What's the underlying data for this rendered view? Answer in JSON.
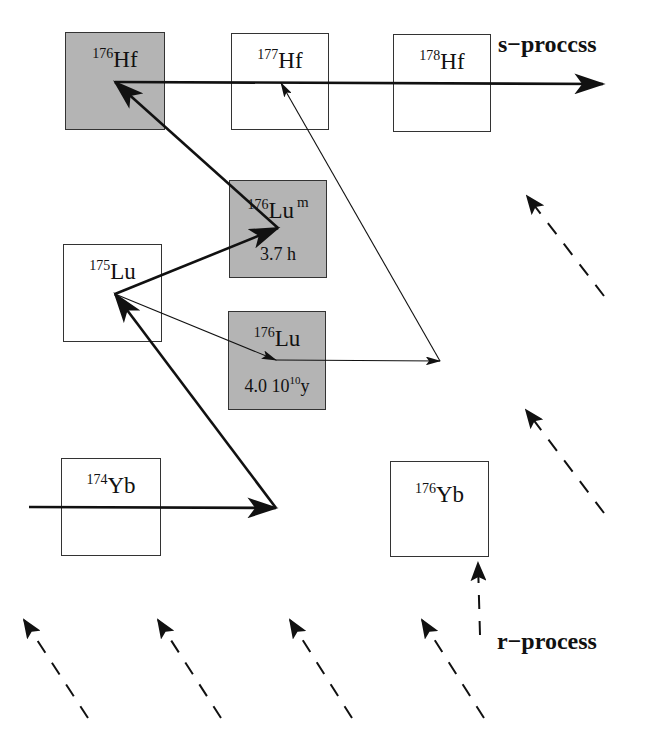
{
  "diagram": {
    "process_labels": {
      "s_process": "s−proccss",
      "r_process": "r−process"
    },
    "nuclides": [
      {
        "id": "hf176",
        "mass": "176",
        "symbol": "Hf",
        "meta": "",
        "half_life": "",
        "stable_shaded": true,
        "box": [
          65,
          32,
          100,
          98
        ]
      },
      {
        "id": "hf177",
        "mass": "177",
        "symbol": "Hf",
        "meta": "",
        "half_life": "",
        "stable_shaded": false,
        "box": [
          231,
          33,
          98,
          97
        ]
      },
      {
        "id": "hf178",
        "mass": "178",
        "symbol": "Hf",
        "meta": "",
        "half_life": "",
        "stable_shaded": false,
        "box": [
          393,
          34,
          98,
          98
        ]
      },
      {
        "id": "lu176m",
        "mass": "176",
        "symbol": "Lu",
        "meta": "m",
        "half_life": "3.7 h",
        "stable_shaded": true,
        "box": [
          229,
          180,
          98,
          98
        ]
      },
      {
        "id": "lu175",
        "mass": "175",
        "symbol": "Lu",
        "meta": "",
        "half_life": "",
        "stable_shaded": false,
        "box": [
          63,
          244,
          99,
          98
        ]
      },
      {
        "id": "lu176",
        "mass": "176",
        "symbol": "Lu",
        "meta": "",
        "half_life_mantissa": "4.0 10",
        "half_life_exp": "10",
        "half_life_unit": "y",
        "stable_shaded": true,
        "box": [
          228,
          311,
          98,
          99
        ]
      },
      {
        "id": "yb174",
        "mass": "174",
        "symbol": "Yb",
        "meta": "",
        "half_life": "",
        "stable_shaded": false,
        "box": [
          61,
          458,
          100,
          98
        ]
      },
      {
        "id": "yb176",
        "mass": "176",
        "symbol": "Yb",
        "meta": "",
        "half_life": "",
        "stable_shaded": false,
        "box": [
          390,
          461,
          99,
          96
        ]
      }
    ],
    "arrows": {
      "solid_thick": [
        {
          "name": "s-process-main-path",
          "from": [
            115,
            82
          ],
          "to": [
            603,
            84
          ]
        },
        {
          "name": "yb174-neutron-capture",
          "from": [
            29,
            507
          ],
          "to": [
            276,
            508
          ]
        },
        {
          "name": "yb-to-lu175-beta",
          "from": [
            276,
            508
          ],
          "to": [
            115,
            294
          ]
        },
        {
          "name": "lu175-to-lu176m",
          "from": [
            115,
            294
          ],
          "to": [
            278,
            228
          ]
        },
        {
          "name": "lu176m-to-hf176-beta",
          "from": [
            278,
            228
          ],
          "to": [
            115,
            82
          ]
        }
      ],
      "solid_thin": [
        {
          "name": "lu175-to-lu176-ground",
          "from": [
            115,
            294
          ],
          "to": [
            276,
            360
          ]
        },
        {
          "name": "lu176-to-lu177-capture",
          "from": [
            276,
            360
          ],
          "to": [
            440,
            361
          ]
        },
        {
          "name": "lu177-to-hf177-beta",
          "from": [
            440,
            361
          ],
          "to": [
            281,
            83
          ]
        }
      ],
      "dashed_r_process": [
        {
          "name": "r-feed-1",
          "from": [
            88,
            718
          ],
          "to": [
            24,
            620
          ]
        },
        {
          "name": "r-feed-2",
          "from": [
            221,
            718
          ],
          "to": [
            158,
            620
          ]
        },
        {
          "name": "r-feed-3",
          "from": [
            352,
            718
          ],
          "to": [
            290,
            620
          ]
        },
        {
          "name": "r-feed-4",
          "from": [
            484,
            718
          ],
          "to": [
            422,
            620
          ]
        },
        {
          "name": "r-feed-yb176",
          "from": [
            480,
            635
          ],
          "to": [
            478,
            563
          ]
        },
        {
          "name": "r-feed-lu176",
          "from": [
            604,
            513
          ],
          "to": [
            526,
            410
          ]
        },
        {
          "name": "r-feed-hf176",
          "from": [
            604,
            296
          ],
          "to": [
            527,
            196
          ]
        }
      ]
    },
    "colors": {
      "shaded_box": "#b4b4b4",
      "box_border": "#333333",
      "line": "#111111",
      "background": "#ffffff"
    }
  }
}
